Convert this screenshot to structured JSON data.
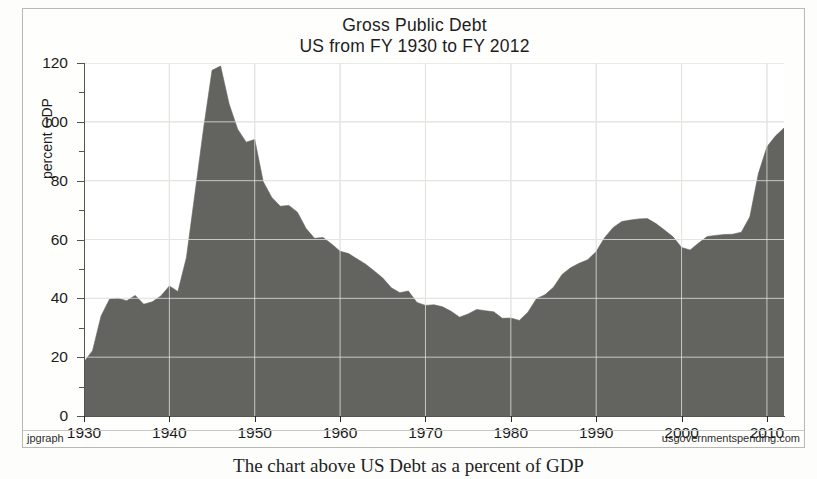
{
  "figure": {
    "footer_left": "jpgraph",
    "footer_right": "usgovernmentspending.com",
    "caption": "The chart above US Debt as a percent of GDP"
  },
  "chart_data": {
    "type": "area",
    "title": "Gross Public Debt",
    "subtitle": "US from FY 1930 to FY 2012",
    "xlabel": "",
    "ylabel": "percent GDP",
    "units": "percent GDP",
    "xlim": [
      1930,
      2012
    ],
    "ylim": [
      0,
      120
    ],
    "ytick_major": [
      0,
      20,
      40,
      60,
      80,
      100,
      120
    ],
    "ytick_minor": [
      10,
      30,
      50,
      70,
      90,
      110
    ],
    "ytick_labels": [
      "0",
      "20",
      "40",
      "60",
      "80",
      "100",
      "120"
    ],
    "xtick_major": [
      1930,
      1940,
      1950,
      1960,
      1970,
      1980,
      1990,
      2000,
      2010
    ],
    "xtick_labels": [
      "1930",
      "1940",
      "1950",
      "1960",
      "1970",
      "1980",
      "1990",
      "2000",
      "2010"
    ],
    "grid": true,
    "grid_color": "#d8d8d4",
    "fill_color": "#63635f",
    "legend": null,
    "series": [
      {
        "name": "Gross Public Debt",
        "x": [
          1930,
          1931,
          1932,
          1933,
          1934,
          1935,
          1936,
          1937,
          1938,
          1939,
          1940,
          1941,
          1942,
          1943,
          1944,
          1945,
          1946,
          1947,
          1948,
          1949,
          1950,
          1951,
          1952,
          1953,
          1954,
          1955,
          1956,
          1957,
          1958,
          1959,
          1960,
          1961,
          1962,
          1963,
          1964,
          1965,
          1966,
          1967,
          1968,
          1969,
          1970,
          1971,
          1972,
          1973,
          1974,
          1975,
          1976,
          1977,
          1978,
          1979,
          1980,
          1981,
          1982,
          1983,
          1984,
          1985,
          1986,
          1987,
          1988,
          1989,
          1990,
          1991,
          1992,
          1993,
          1994,
          1995,
          1996,
          1997,
          1998,
          1999,
          2000,
          2001,
          2002,
          2003,
          2004,
          2005,
          2006,
          2007,
          2008,
          2009,
          2010,
          2011,
          2012
        ],
        "values": [
          18.4,
          22.2,
          34.0,
          39.8,
          40.0,
          39.2,
          41.0,
          38.0,
          38.8,
          40.8,
          44.2,
          42.3,
          53.9,
          75.7,
          97.6,
          117.5,
          119.0,
          106.1,
          97.5,
          93.1,
          94.0,
          79.6,
          74.3,
          71.3,
          71.6,
          69.3,
          63.8,
          60.4,
          60.7,
          58.5,
          56.0,
          55.2,
          53.4,
          51.6,
          49.3,
          46.9,
          43.6,
          41.9,
          42.5,
          38.6,
          37.6,
          37.8,
          37.1,
          35.6,
          33.6,
          34.7,
          36.2,
          35.8,
          35.4,
          33.2,
          33.3,
          32.5,
          35.3,
          39.9,
          41.2,
          43.8,
          48.1,
          50.4,
          51.9,
          53.1,
          55.9,
          60.7,
          64.1,
          66.1,
          66.6,
          67.0,
          67.1,
          65.4,
          63.2,
          60.9,
          57.3,
          56.4,
          58.8,
          61.0,
          61.4,
          61.7,
          61.8,
          62.5,
          67.7,
          82.4,
          91.5,
          95.2,
          97.9
        ]
      }
    ]
  }
}
